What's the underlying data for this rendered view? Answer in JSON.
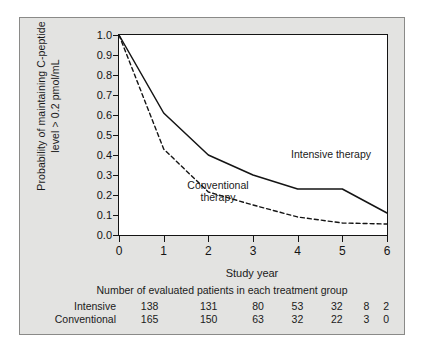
{
  "figure": {
    "y_axis_title_line1": "Probability of maintaining C-peptide",
    "y_axis_title_line2": "level > 0.2 pmol/mL",
    "x_axis_title": "Study year",
    "series_labels": {
      "intensive": "Intensive therapy",
      "conventional_line1": "Conventional",
      "conventional_line2": "therapy"
    },
    "colors": {
      "background": "#e3e3e1",
      "plot_background": "#ffffff",
      "axis": "#141414",
      "intensive_line": "#141414",
      "conventional_line": "#141414"
    }
  },
  "risk_table": {
    "caption": "Number of evaluated patients in each treatment group",
    "rows": [
      {
        "label": "Intensive",
        "values": [
          "138",
          "131",
          "80",
          "53",
          "32",
          "8",
          "2"
        ]
      },
      {
        "label": "Conventional",
        "values": [
          "165",
          "150",
          "63",
          "32",
          "22",
          "3",
          "0"
        ]
      }
    ]
  },
  "chart_data": {
    "type": "line",
    "title": "",
    "xlabel": "Study year",
    "ylabel": "Probability of maintaining C-peptide level > 0.2 pmol/mL",
    "xlim": [
      0,
      6
    ],
    "ylim": [
      0.0,
      1.0
    ],
    "grid": false,
    "legend_position": "inline-annotations",
    "xticks": [
      "0",
      "1",
      "2",
      "3",
      "4",
      "5",
      "6"
    ],
    "yticks": [
      "0.0",
      "0.1",
      "0.2",
      "0.3",
      "0.4",
      "0.5",
      "0.6",
      "0.7",
      "0.8",
      "0.9",
      "1.0"
    ],
    "x": [
      0,
      1,
      2,
      3,
      4,
      5,
      6
    ],
    "series": [
      {
        "name": "Intensive therapy",
        "style": "solid",
        "values": [
          1.0,
          0.61,
          0.4,
          0.3,
          0.23,
          0.23,
          0.11
        ]
      },
      {
        "name": "Conventional therapy",
        "style": "dashed",
        "values": [
          1.0,
          0.43,
          0.215,
          0.15,
          0.09,
          0.06,
          0.055
        ]
      }
    ],
    "annotations": [
      {
        "text": "Intensive therapy",
        "x": 4.6,
        "y": 0.3
      },
      {
        "text": "Conventional therapy",
        "x": 1.95,
        "y": 0.12
      }
    ]
  }
}
